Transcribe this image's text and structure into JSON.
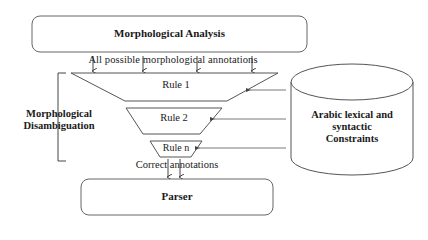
{
  "diagram": {
    "top_box": {
      "label": "Morphological Analysis"
    },
    "input_label": "All possible morphological annotations",
    "group_label": {
      "line1": "Morphological",
      "line2": "Disambiguation"
    },
    "rules": [
      {
        "label": "Rule 1"
      },
      {
        "label": "Rule 2"
      },
      {
        "label": "Rule n"
      }
    ],
    "database": {
      "line1": "Arabic lexical and",
      "line2": "syntactic",
      "line3": "Constraints"
    },
    "output_label": "Correct annotations",
    "bottom_box": {
      "label": "Parser"
    },
    "colors": {
      "stroke": "#555555",
      "text": "#1a1a1a",
      "background": "#ffffff"
    }
  }
}
